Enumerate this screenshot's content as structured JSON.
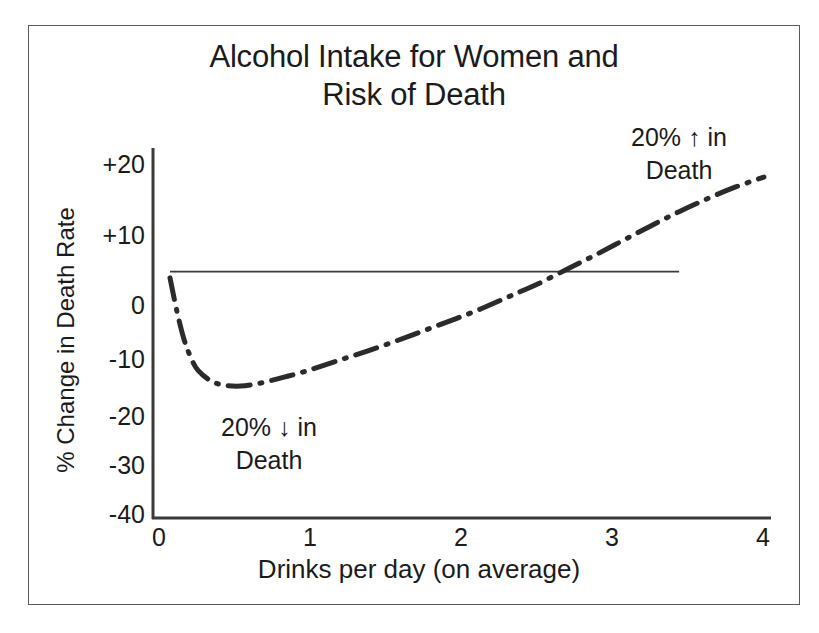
{
  "chart_data": {
    "type": "line",
    "title": "Alcohol Intake for Women and Risk of Death",
    "title_line1": "Alcohol Intake for Women and",
    "title_line2": "Risk of Death",
    "xlabel": "Drinks per day (on average)",
    "ylabel": "% Change in Death Rate",
    "xlim": [
      -0.12,
      4.25
    ],
    "ylim": [
      -40,
      20
    ],
    "xticks": [
      "0",
      "1",
      "2",
      "3",
      "4"
    ],
    "xtick_values": [
      0,
      1,
      2,
      3,
      4
    ],
    "yticks": [
      "+20",
      "+10",
      "0",
      "-10",
      "-20",
      "-30",
      "-40"
    ],
    "ytick_values": [
      20,
      10,
      0,
      -10,
      -20,
      -30,
      -40
    ],
    "grid": false,
    "legend": "none",
    "line_style": "dash-dot",
    "line_color": "#2b2b2b",
    "reference_line": {
      "y": 0,
      "x_from": 0,
      "x_to": 3.6,
      "color": "#3a3a3a"
    },
    "x": [
      0.0,
      0.05,
      0.1,
      0.15,
      0.2,
      0.3,
      0.4,
      0.5,
      0.6,
      0.7,
      0.8,
      0.9,
      1.0,
      1.2,
      1.4,
      1.6,
      1.8,
      2.0,
      2.2,
      2.4,
      2.5,
      2.6,
      2.8,
      3.0,
      3.2,
      3.4,
      3.6,
      3.8,
      4.0,
      4.2
    ],
    "y": [
      -1.0,
      -6.5,
      -11.0,
      -14.0,
      -16.0,
      -17.8,
      -18.4,
      -18.5,
      -18.2,
      -17.7,
      -17.1,
      -16.5,
      -15.8,
      -14.3,
      -12.8,
      -11.2,
      -9.5,
      -7.8,
      -6.0,
      -4.0,
      -3.0,
      -2.0,
      0.3,
      2.6,
      5.0,
      7.4,
      9.7,
      11.8,
      13.7,
      15.3
    ],
    "annotations": [
      {
        "id": "increase",
        "line1": "20% ↑ in",
        "line2": "Death"
      },
      {
        "id": "decrease",
        "line1": "20% ↓ in",
        "line2": "Death"
      }
    ]
  },
  "axes": {
    "y_title": "% Change in Death Rate",
    "x_title": "Drinks per day (on average)",
    "y_tick_labels": [
      "+20",
      "+10",
      "0",
      "-10",
      "-20",
      "-30",
      "-40"
    ],
    "x_tick_labels": [
      "0",
      "1",
      "2",
      "3",
      "4"
    ]
  },
  "title": {
    "line1": "Alcohol Intake for Women and",
    "line2": "Risk of Death"
  },
  "annotations": {
    "increase": {
      "line1": "20% ↑ in",
      "line2": "Death"
    },
    "decrease": {
      "line1": "20% ↓ in",
      "line2": "Death"
    }
  },
  "colors": {
    "line": "#2b2b2b",
    "axis": "#3a3a3a",
    "frame": "#5a5a5a",
    "text": "#1b1b1b",
    "background": "#ffffff"
  }
}
